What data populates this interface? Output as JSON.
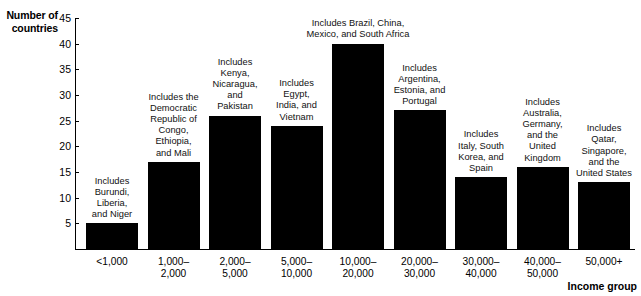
{
  "chart_data": {
    "type": "bar",
    "title": "",
    "xlabel": "Income group",
    "ylabel": "Number of countries",
    "ylim": [
      0,
      45
    ],
    "yticks": [
      5,
      10,
      15,
      20,
      25,
      30,
      35,
      40,
      45
    ],
    "grid": false,
    "legend": "none",
    "bar_color": "#000000",
    "categories": [
      "<1,000",
      "1,000–2,000",
      "2,000–5,000",
      "5,000–10,000",
      "10,000–20,000",
      "20,000–30,000",
      "30,000–40,000",
      "40,000–50,000",
      "50,000+"
    ],
    "values": [
      5,
      17,
      26,
      24,
      40,
      27,
      14,
      16,
      13
    ],
    "annotations": [
      "Includes Burundi, Liberia, and Niger",
      "Includes the Democratic Republic of Congo, Ethiopia, and Mali",
      "Includes Kenya, Nicaragua, and Pakistan",
      "Includes Egypt, India, and Vietnam",
      "Includes Brazil, China, Mexico, and South Africa",
      "Includes Argentina, Estonia, and Portugal",
      "Includes Italy, South Korea, and Spain",
      "Includes Australia, Germany, and the United Kingdom",
      "Includes Qatar, Singapore, and the United States"
    ]
  },
  "axes": {
    "y_title_line1": "Number of",
    "y_title_line2": "countries",
    "x_title": "Income group",
    "ytick_labels": [
      "45",
      "40",
      "35",
      "30",
      "25",
      "20",
      "15",
      "10",
      "5"
    ]
  },
  "bars": [
    {
      "category_line1": "<1,000",
      "category_line2": "",
      "value": 5,
      "annotation_lines": [
        "Includes",
        "Burundi,",
        "Liberia,",
        "and Niger"
      ]
    },
    {
      "category_line1": "1,000–",
      "category_line2": "2,000",
      "value": 17,
      "annotation_lines": [
        "Includes the",
        "Democratic",
        "Republic of",
        "Congo,",
        "Ethiopia,",
        "and Mali"
      ]
    },
    {
      "category_line1": "2,000–",
      "category_line2": "5,000",
      "value": 26,
      "annotation_lines": [
        "Includes",
        "Kenya,",
        "Nicaragua,",
        "and",
        "Pakistan"
      ]
    },
    {
      "category_line1": "5,000–",
      "category_line2": "10,000",
      "value": 24,
      "annotation_lines": [
        "Includes",
        "Egypt,",
        "India, and",
        "Vietnam"
      ]
    },
    {
      "category_line1": "10,000–",
      "category_line2": "20,000",
      "value": 40,
      "annotation_lines": [
        "Includes Brazil, China,",
        "Mexico, and South Africa"
      ]
    },
    {
      "category_line1": "20,000–",
      "category_line2": "30,000",
      "value": 27,
      "annotation_lines": [
        "Includes",
        "Argentina,",
        "Estonia, and",
        "Portugal"
      ]
    },
    {
      "category_line1": "30,000–",
      "category_line2": "40,000",
      "value": 14,
      "annotation_lines": [
        "Includes",
        "Italy, South",
        "Korea, and",
        "Spain"
      ]
    },
    {
      "category_line1": "40,000–",
      "category_line2": "50,000",
      "value": 16,
      "annotation_lines": [
        "Includes",
        "Australia,",
        "Germany,",
        "and the",
        "United",
        "Kingdom"
      ]
    },
    {
      "category_line1": "50,000+",
      "category_line2": "",
      "value": 13,
      "annotation_lines": [
        "Includes",
        "Qatar,",
        "Singapore,",
        "and the",
        "United States"
      ]
    }
  ]
}
